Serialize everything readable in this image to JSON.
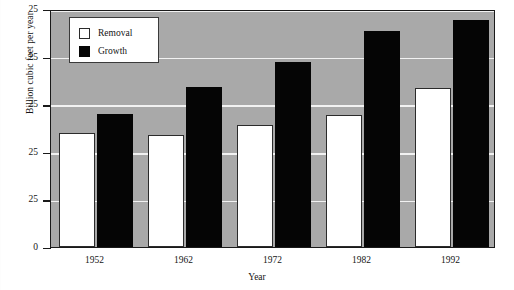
{
  "chart_data": {
    "type": "bar",
    "title": "",
    "subtitle": "",
    "xlabel": "Year",
    "ylabel": "Billion cubic feet per year",
    "categories": [
      "1952",
      "1962",
      "1972",
      "1982",
      "1992"
    ],
    "series": [
      {
        "name": "Removal",
        "values": [
          12.0,
          11.8,
          12.8,
          13.9,
          16.7
        ],
        "color": "#ffffff"
      },
      {
        "name": "Growth",
        "values": [
          14.0,
          16.8,
          19.4,
          22.7,
          23.8
        ],
        "color": "#050505"
      }
    ],
    "ylim": [
      0,
      25
    ],
    "yticks": [
      "0",
      "25",
      "25",
      "25",
      "25",
      "25"
    ],
    "ytick_values": [
      0,
      5,
      10,
      15,
      20,
      25
    ],
    "grid": true,
    "legend_position": "top-left",
    "plot_background": "#a9a9a9",
    "gridline_color": "#f2f2f2",
    "axis_color": "#1a1a1a"
  },
  "axis": {
    "y_title": "Billion cubic feet per year",
    "x_title": "Year",
    "y_tick_labels": [
      "25",
      "25",
      "25",
      "25",
      "25",
      "0"
    ]
  },
  "legend": {
    "items": [
      {
        "label": "Removal",
        "swatch": "white-square-swatch"
      },
      {
        "label": "Growth",
        "swatch": "black-square-swatch"
      }
    ]
  }
}
